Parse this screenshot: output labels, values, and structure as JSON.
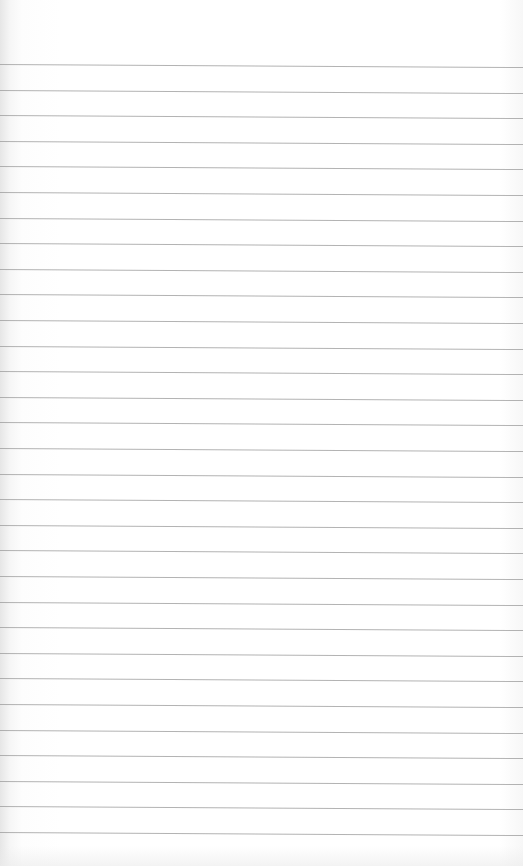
{
  "page": {
    "type": "blank lined paper",
    "background_color": "#ffffff",
    "line_color": "#9a9a9a",
    "line_count": 31,
    "first_line_y": 64,
    "line_spacing": 25.6
  }
}
